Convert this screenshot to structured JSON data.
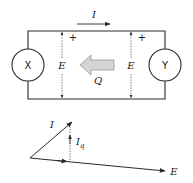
{
  "circuit": {
    "left_source_label": "X",
    "right_source_label": "Y",
    "current_label": "I",
    "left_voltage_label": "E",
    "right_voltage_label": "E",
    "left_polarity": "+",
    "right_polarity": "+",
    "reactive_power_label": "Q",
    "reactive_power_direction": "right-to-left"
  },
  "phasor": {
    "current_label": "I",
    "quadrature_label": "I",
    "quadrature_subscript": "q",
    "voltage_label": "E"
  },
  "colors": {
    "line": "#2a2a2a",
    "q_arrow_fill": "#d4d4d4",
    "q_arrow_stroke": "#9a9a9a"
  }
}
